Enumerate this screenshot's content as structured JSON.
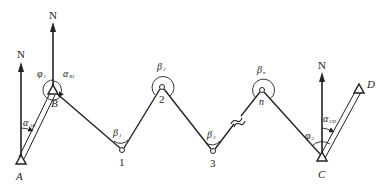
{
  "diagram": {
    "colors": {
      "stroke": "#222222",
      "background": "#ffffff"
    },
    "north_label": "N",
    "stations": {
      "A": {
        "label": "A",
        "type": "known-control-point",
        "x": 21,
        "y": 160
      },
      "B": {
        "label": "B",
        "type": "known-control-point",
        "x": 53,
        "y": 90
      },
      "P1": {
        "label": "1",
        "type": "traverse-point",
        "x": 122,
        "y": 150
      },
      "P2": {
        "label": "2",
        "type": "traverse-point",
        "x": 162,
        "y": 86
      },
      "P3": {
        "label": "3",
        "type": "traverse-point",
        "x": 213,
        "y": 151
      },
      "Pn": {
        "label": "n",
        "type": "traverse-point",
        "x": 262,
        "y": 89
      },
      "C": {
        "label": "C",
        "type": "known-control-point",
        "x": 322,
        "y": 157
      },
      "D": {
        "label": "D",
        "type": "known-control-point",
        "x": 359,
        "y": 89
      }
    },
    "angles": {
      "alpha_AB": {
        "symbol": "α",
        "sub": "AB"
      },
      "alpha_B1": {
        "symbol": "α",
        "sub": "B1"
      },
      "phi_1": {
        "symbol": "φ",
        "sub": "1"
      },
      "phi_2": {
        "symbol": "φ",
        "sub": "2"
      },
      "alpha_CD": {
        "symbol": "α",
        "sub": "CD"
      },
      "beta_1": {
        "symbol": "β",
        "sub": "1"
      },
      "beta_2": {
        "symbol": "β",
        "sub": "2"
      },
      "beta_3": {
        "symbol": "β",
        "sub": "3"
      },
      "beta_n": {
        "symbol": "β",
        "sub": "n"
      }
    },
    "break_mark": "≈"
  }
}
